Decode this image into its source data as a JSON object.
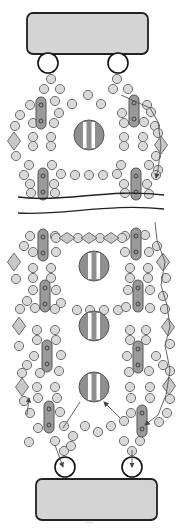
{
  "diagram": {
    "width": 184,
    "height": 531,
    "colors": {
      "background": "#ffffff",
      "seed_bead": "#d9d9d9",
      "tube_bead": "#9a9a9a",
      "clasp_bar": "#d4d4d4",
      "focal_bead": "#8f8f8f",
      "thread": "#555555"
    },
    "clasp_bars": [
      {
        "name": "top-clasp-bar",
        "x": 27,
        "y": 13,
        "w": 121,
        "h": 41,
        "r": 6
      },
      {
        "name": "bottom-clasp-bar",
        "x": 36,
        "y": 479,
        "w": 121,
        "h": 41,
        "r": 6
      }
    ],
    "jump_rings": [
      {
        "cx": 48,
        "cy": 63,
        "r": 10
      },
      {
        "cx": 118,
        "cy": 63,
        "r": 10
      },
      {
        "cx": 65,
        "cy": 467,
        "r": 10
      },
      {
        "cx": 132,
        "cy": 467,
        "r": 10
      }
    ],
    "focal_beads": [
      {
        "cx": 89,
        "cy": 135,
        "r": 15
      },
      {
        "cx": 94,
        "cy": 266,
        "r": 15
      },
      {
        "cx": 94,
        "cy": 326,
        "r": 15
      },
      {
        "cx": 94,
        "cy": 387,
        "r": 15
      }
    ],
    "tube_beads": [
      {
        "cx": 41,
        "cy": 113,
        "len": 32
      },
      {
        "cx": 134,
        "cy": 111,
        "len": 32
      },
      {
        "cx": 43,
        "cy": 184,
        "len": 32
      },
      {
        "cx": 136,
        "cy": 184,
        "len": 32
      },
      {
        "cx": 43,
        "cy": 245,
        "len": 32
      },
      {
        "cx": 136,
        "cy": 244,
        "len": 32
      },
      {
        "cx": 45,
        "cy": 296,
        "len": 32
      },
      {
        "cx": 138,
        "cy": 296,
        "len": 32
      },
      {
        "cx": 47,
        "cy": 356,
        "len": 32
      },
      {
        "cx": 138,
        "cy": 357,
        "len": 32
      },
      {
        "cx": 49,
        "cy": 417,
        "len": 32
      },
      {
        "cx": 142,
        "cy": 421,
        "len": 32
      }
    ],
    "diamonds": [
      {
        "cx": 14,
        "cy": 141,
        "w": 13,
        "h": 18
      },
      {
        "cx": 161,
        "cy": 145,
        "w": 13,
        "h": 18
      },
      {
        "cx": 14,
        "cy": 262,
        "w": 13,
        "h": 18
      },
      {
        "cx": 163,
        "cy": 262,
        "w": 13,
        "h": 18
      },
      {
        "cx": 19,
        "cy": 326,
        "w": 13,
        "h": 18
      },
      {
        "cx": 168,
        "cy": 327,
        "w": 13,
        "h": 18
      },
      {
        "cx": 22,
        "cy": 387,
        "w": 13,
        "h": 18
      },
      {
        "cx": 169,
        "cy": 386,
        "w": 13,
        "h": 18
      },
      {
        "cx": 67,
        "cy": 238,
        "w": 16,
        "h": 11
      },
      {
        "cx": 89,
        "cy": 238,
        "w": 16,
        "h": 11
      },
      {
        "cx": 111,
        "cy": 238,
        "w": 16,
        "h": 11
      }
    ],
    "seed_beads": [
      [
        51,
        79
      ],
      [
        117,
        79
      ],
      [
        44,
        89
      ],
      [
        60,
        89
      ],
      [
        113,
        89
      ],
      [
        128,
        89
      ],
      [
        88,
        95
      ],
      [
        30,
        105
      ],
      [
        55,
        101
      ],
      [
        72,
        104
      ],
      [
        101,
        104
      ],
      [
        147,
        105
      ],
      [
        20,
        115
      ],
      [
        59,
        113
      ],
      [
        122,
        113
      ],
      [
        151,
        112
      ],
      [
        155,
        126
      ],
      [
        15,
        126
      ],
      [
        33,
        123
      ],
      [
        54,
        123
      ],
      [
        124,
        123
      ],
      [
        144,
        122
      ],
      [
        33,
        137
      ],
      [
        51,
        137
      ],
      [
        124,
        137
      ],
      [
        143,
        137
      ],
      [
        158,
        133
      ],
      [
        33,
        146
      ],
      [
        51,
        146
      ],
      [
        124,
        146
      ],
      [
        143,
        146
      ],
      [
        16,
        156
      ],
      [
        156,
        156
      ],
      [
        158,
        170
      ],
      [
        29,
        165
      ],
      [
        52,
        165
      ],
      [
        121,
        165
      ],
      [
        149,
        165
      ],
      [
        24,
        175
      ],
      [
        61,
        174
      ],
      [
        75,
        175
      ],
      [
        89,
        175
      ],
      [
        103,
        175
      ],
      [
        117,
        174
      ],
      [
        156,
        175
      ],
      [
        30,
        184
      ],
      [
        54,
        184
      ],
      [
        124,
        184
      ],
      [
        147,
        184
      ],
      [
        31,
        193
      ],
      [
        55,
        193
      ],
      [
        125,
        193
      ],
      [
        149,
        194
      ],
      [
        30,
        236
      ],
      [
        55,
        236
      ],
      [
        125,
        236
      ],
      [
        145,
        235
      ],
      [
        78,
        238
      ],
      [
        100,
        238
      ],
      [
        56,
        238
      ],
      [
        122,
        238
      ],
      [
        24,
        246
      ],
      [
        157,
        246
      ],
      [
        33,
        252
      ],
      [
        56,
        252
      ],
      [
        125,
        252
      ],
      [
        149,
        252
      ],
      [
        33,
        268
      ],
      [
        51,
        268
      ],
      [
        130,
        268
      ],
      [
        148,
        268
      ],
      [
        33,
        278
      ],
      [
        51,
        278
      ],
      [
        130,
        278
      ],
      [
        148,
        278
      ],
      [
        16,
        279
      ],
      [
        166,
        278
      ],
      [
        33,
        290
      ],
      [
        56,
        290
      ],
      [
        128,
        290
      ],
      [
        150,
        290
      ],
      [
        27,
        301
      ],
      [
        163,
        296
      ],
      [
        20,
        309
      ],
      [
        61,
        303
      ],
      [
        77,
        310
      ],
      [
        90,
        310
      ],
      [
        104,
        310
      ],
      [
        118,
        310
      ],
      [
        165,
        309
      ],
      [
        35,
        308
      ],
      [
        55,
        309
      ],
      [
        126,
        307
      ],
      [
        150,
        308
      ],
      [
        37,
        330
      ],
      [
        55,
        330
      ],
      [
        130,
        330
      ],
      [
        146,
        330
      ],
      [
        37,
        340
      ],
      [
        56,
        340
      ],
      [
        130,
        340
      ],
      [
        146,
        340
      ],
      [
        19,
        346
      ],
      [
        170,
        344
      ],
      [
        34,
        356
      ],
      [
        61,
        355
      ],
      [
        127,
        356
      ],
      [
        156,
        356
      ],
      [
        27,
        365
      ],
      [
        163,
        365
      ],
      [
        22,
        373
      ],
      [
        40,
        373
      ],
      [
        59,
        371
      ],
      [
        129,
        372
      ],
      [
        149,
        371
      ],
      [
        170,
        371
      ],
      [
        37,
        387
      ],
      [
        55,
        387
      ],
      [
        130,
        387
      ],
      [
        150,
        387
      ],
      [
        38,
        398
      ],
      [
        57,
        398
      ],
      [
        131,
        398
      ],
      [
        150,
        398
      ],
      [
        24,
        401
      ],
      [
        170,
        399
      ],
      [
        60,
        412
      ],
      [
        131,
        413
      ],
      [
        30,
        413
      ],
      [
        167,
        413
      ],
      [
        38,
        428
      ],
      [
        64,
        426
      ],
      [
        85,
        426
      ],
      [
        98,
        432
      ],
      [
        111,
        426
      ],
      [
        124,
        421
      ],
      [
        159,
        422
      ],
      [
        55,
        441
      ],
      [
        73,
        436
      ],
      [
        124,
        441
      ],
      [
        140,
        441
      ],
      [
        64,
        451
      ],
      [
        132,
        451
      ],
      [
        29,
        442
      ],
      [
        71,
        446
      ]
    ],
    "break_marks": [
      {
        "d": "M18 197 C60 203 110 188 164 195"
      },
      {
        "d": "M18 213 C60 216 110 203 164 209"
      }
    ],
    "thread_paths": [
      {
        "d": "M121 95 L150 108 L158 122 L161 145 L158 170 L156 178",
        "arrow_end": true
      },
      {
        "d": "M155 222 L157 240 L165 262 L161 285 L167 305 L170 327 L165 345 L170 370 L166 395 L158 415 L145 425",
        "arrow_end": true
      },
      {
        "d": "M63 428 L80 402"
      },
      {
        "d": "M120 418 L104 402",
        "arrow_end": true
      },
      {
        "d": "M55 445 L63 467",
        "arrow_end": true
      },
      {
        "d": "M132 450 L132 467",
        "arrow_end": true
      },
      {
        "d": "M27 415 L29 398",
        "arrow_end": true
      }
    ],
    "footer_mark": "—"
  }
}
